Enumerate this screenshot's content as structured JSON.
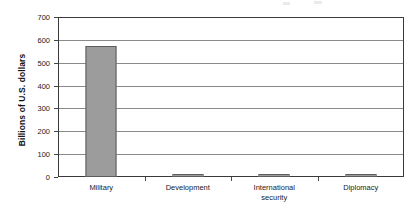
{
  "chart_data": {
    "type": "bar",
    "title": "",
    "xlabel": "",
    "ylabel": "Billions of U.S. dollars",
    "categories": [
      "Military",
      "Development",
      "International security",
      "Diplomacy"
    ],
    "category_lines": [
      [
        "Military"
      ],
      [
        "Development"
      ],
      [
        "International",
        "security"
      ],
      [
        "Diplomacy"
      ]
    ],
    "values": [
      575,
      15,
      13,
      10
    ],
    "ylim": [
      0,
      700
    ],
    "ytick_values": [
      0,
      100,
      200,
      300,
      400,
      500,
      600,
      700
    ],
    "ytick_labels": [
      "0",
      "100",
      "200",
      "300",
      "400",
      "500",
      "600",
      "700"
    ],
    "grid": true,
    "legend": false,
    "bar_color": "#9c9c9c",
    "bar_border_color": "#5c5c5c",
    "gridline_color": "#8a8a8a",
    "frame_color": "#3a3a3a",
    "background": "#ffffff"
  }
}
